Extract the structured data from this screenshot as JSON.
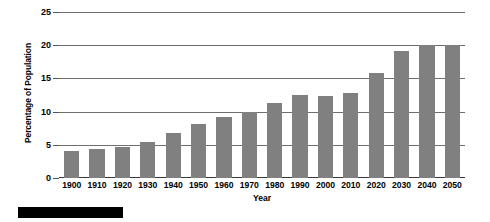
{
  "chart_data": {
    "type": "bar",
    "title": "",
    "xlabel": "Year",
    "ylabel": "Percentage of Population",
    "categories": [
      "1900",
      "1910",
      "1920",
      "1930",
      "1940",
      "1950",
      "1960",
      "1970",
      "1980",
      "1990",
      "2000",
      "2010",
      "2020",
      "2030",
      "2040",
      "2050"
    ],
    "values": [
      4.1,
      4.3,
      4.7,
      5.4,
      6.8,
      8.1,
      9.2,
      10.0,
      11.3,
      12.5,
      12.3,
      12.8,
      15.8,
      19.1,
      20.0,
      20.0
    ],
    "series": [
      {
        "name": "Percentage of Population",
        "values": [
          4.1,
          4.3,
          4.7,
          5.4,
          6.8,
          8.1,
          9.2,
          10.0,
          11.3,
          12.5,
          12.3,
          12.8,
          15.8,
          19.1,
          20.0,
          20.0
        ]
      }
    ],
    "ylim": [
      0,
      25
    ],
    "yticks": [
      0,
      5,
      10,
      15,
      20,
      25
    ],
    "ytick_labels": [
      "0",
      "5",
      "10",
      "15",
      "20",
      "25"
    ],
    "grid": true,
    "grid_axis": "y",
    "legend": false,
    "legend_position": "none",
    "bar_color": "#808080",
    "gridline_color": "#6f6f6f",
    "axis_color": "#3a3a3a",
    "text_color": "#000000"
  },
  "artifacts": {
    "scan_bar_label": ""
  }
}
